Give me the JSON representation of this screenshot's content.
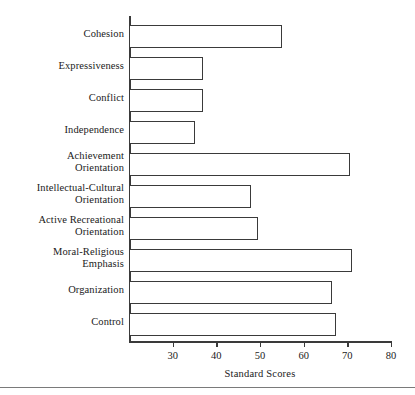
{
  "chart_data": {
    "type": "bar",
    "orientation": "horizontal",
    "title": "",
    "xlabel": "Standard Scores",
    "ylabel": "",
    "xlim": [
      20,
      80
    ],
    "xticks": [
      30,
      40,
      50,
      60,
      70,
      80
    ],
    "xtick_labels": [
      "30",
      "40",
      "50",
      "60",
      "70",
      "80"
    ],
    "grid": false,
    "legend": null,
    "categories": [
      "Cohesion",
      "Expressiveness",
      "Conflict",
      "Independence",
      "Achievement\nOrientation",
      "Intellectual-Cultural\nOrientation",
      "Active Recreational\nOrientation",
      "Moral-Religious\nEmphasis",
      "Organization",
      "Control"
    ],
    "values": [
      55,
      37,
      37,
      35,
      70.5,
      48,
      49.5,
      71,
      66.5,
      67.5
    ],
    "bar_fill": "#ffffff",
    "bar_edge": "#3a3a3a",
    "axis_color": "#3a3a3a",
    "background": "#ffffff"
  },
  "geometry": {
    "rows": [
      {
        "top": 25
      },
      {
        "top": 57
      },
      {
        "top": 89
      },
      {
        "top": 121
      },
      {
        "top": 153
      },
      {
        "top": 185
      },
      {
        "top": 217
      },
      {
        "top": 249
      },
      {
        "top": 281
      },
      {
        "top": 313
      }
    ],
    "label_tops": [
      28,
      60,
      92,
      124,
      150,
      182,
      214,
      246,
      284,
      316
    ]
  }
}
